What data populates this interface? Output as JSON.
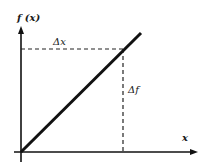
{
  "diagram": {
    "type": "linear-function-graph",
    "y_axis_label": "f (x)",
    "x_axis_label": "x",
    "delta_x_label": "Δx",
    "delta_f_label": "Δf",
    "colors": {
      "line": "#111111",
      "axes": "#111111",
      "dashes": "#222222",
      "background": "#ffffff"
    }
  }
}
